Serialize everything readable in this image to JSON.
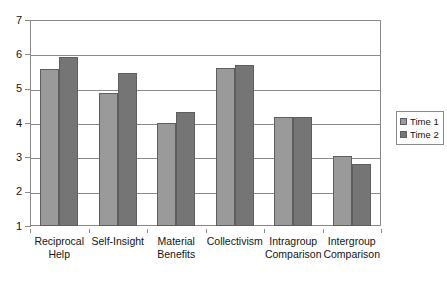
{
  "chart_data": {
    "type": "bar",
    "title": "",
    "subtitle": "",
    "xlabel": "",
    "ylabel": "",
    "ylim": [
      1,
      7
    ],
    "yticks": [
      1,
      2,
      3,
      4,
      5,
      6,
      7
    ],
    "ytick_labels": [
      "1",
      "2",
      "3",
      "4",
      "5",
      "6",
      "7"
    ],
    "grid": true,
    "legend_position": "right",
    "categories": [
      "Reciprocal Help",
      "Self-Insight",
      "Material Benefits",
      "Collectivism",
      "Intragroup Comparison",
      "Intergroup Comparison"
    ],
    "series": [
      {
        "name": "Time 1",
        "color": "#9a9a9a",
        "values": [
          5.58,
          4.88,
          4.0,
          5.6,
          4.18,
          3.05
        ]
      },
      {
        "name": "Time 2",
        "color": "#757575",
        "values": [
          5.92,
          5.45,
          4.33,
          5.7,
          4.17,
          2.82
        ]
      }
    ]
  },
  "legend": {
    "entries": [
      {
        "label": "Time 1",
        "color": "#9a9a9a"
      },
      {
        "label": "Time 2",
        "color": "#757575"
      }
    ]
  },
  "axis": {
    "frame_color": "#8a8a8a",
    "bar_border_color": "#5e5e5e"
  }
}
